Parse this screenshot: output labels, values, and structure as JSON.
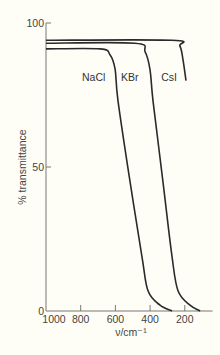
{
  "chart_data": {
    "type": "line",
    "title": "",
    "xlabel": "ν/cm⁻¹",
    "ylabel": "% transmittance",
    "xlim": [
      1000,
      40
    ],
    "ylim": [
      0,
      100
    ],
    "x_reversed": true,
    "grid": false,
    "legend": "inline labels",
    "x_ticks": [
      1000,
      800,
      600,
      400,
      200
    ],
    "x_tick_labels": [
      "1000",
      "800",
      "600",
      "400",
      "200"
    ],
    "y_ticks": [
      0,
      50,
      100
    ],
    "y_tick_labels": [
      "0",
      "50",
      "100"
    ],
    "series": [
      {
        "name": "NaCl",
        "label": "NaCl",
        "x": [
          1000,
          689,
          631,
          602,
          585,
          516,
          447,
          412,
          343,
          274
        ],
        "y": [
          91,
          91,
          89,
          84,
          73,
          45,
          19,
          7,
          2,
          0
        ],
        "label_pos": {
          "x": 725,
          "y": 80
        }
      },
      {
        "name": "KBr",
        "label": "KBr",
        "x": [
          1000,
          487,
          429,
          401,
          383,
          326,
          274,
          239,
          170,
          112
        ],
        "y": [
          93,
          93,
          90,
          84,
          73,
          45,
          19,
          7,
          2,
          0
        ],
        "label_pos": {
          "x": 517,
          "y": 80
        }
      },
      {
        "name": "CsI",
        "label": "CsI",
        "x": [
          1000,
          274,
          228,
          210,
          193
        ],
        "y": [
          94,
          94,
          92,
          87,
          80
        ],
        "label_pos": {
          "x": 291,
          "y": 80
        }
      }
    ]
  },
  "colors": {
    "background": "#fffef6",
    "curve": "#2a2a2a",
    "axis": "#777777",
    "text": "#444444"
  }
}
